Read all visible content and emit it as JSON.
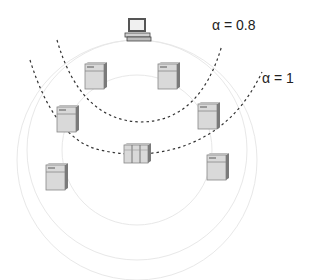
{
  "diagram": {
    "labels": {
      "alpha_inner": "α = 0.8",
      "alpha_outer": "α = 1"
    },
    "nodes": [
      {
        "id": "client",
        "type": "computer",
        "x": 125,
        "y": 18
      },
      {
        "id": "server-1",
        "type": "server",
        "x": 85,
        "y": 62
      },
      {
        "id": "server-2",
        "type": "server",
        "x": 158,
        "y": 62
      },
      {
        "id": "server-3",
        "type": "server",
        "x": 57,
        "y": 105
      },
      {
        "id": "server-4",
        "type": "server",
        "x": 198,
        "y": 102
      },
      {
        "id": "server-cluster",
        "type": "multi-server",
        "x": 124,
        "y": 143
      },
      {
        "id": "server-5",
        "type": "server",
        "x": 46,
        "y": 163
      },
      {
        "id": "server-6",
        "type": "server",
        "x": 207,
        "y": 153
      }
    ],
    "colors": {
      "dashed_arc": "#333333",
      "faint_circle": "#e6e6e6",
      "server_face": "#d9d9d9",
      "server_side": "#7a7a7a"
    }
  }
}
